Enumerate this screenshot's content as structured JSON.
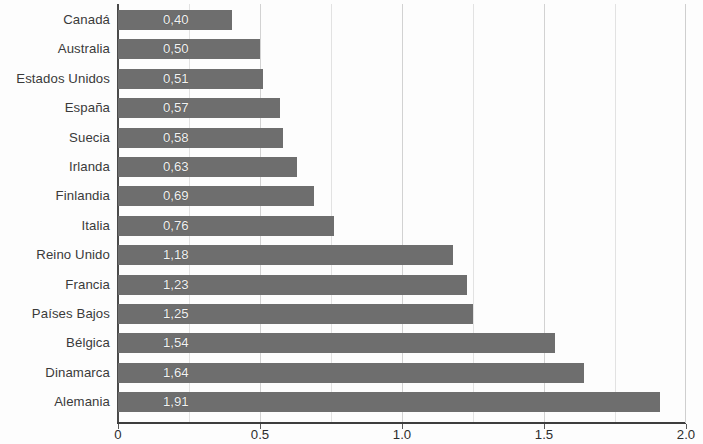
{
  "chart_data": {
    "type": "bar",
    "orientation": "horizontal",
    "title": "",
    "subtitle": "",
    "xlabel": "",
    "ylabel": "",
    "xlim": [
      0,
      2.0
    ],
    "grid": true,
    "legend": null,
    "decimal_separator": ",",
    "categories": [
      "Canadá",
      "Australia",
      "Estados Unidos",
      "España",
      "Suecia",
      "Irlanda",
      "Finlandia",
      "Italia",
      "Reino Unido",
      "Francia",
      "Países Bajos",
      "Bélgica",
      "Dinamarca",
      "Alemania"
    ],
    "values": [
      0.4,
      0.5,
      0.51,
      0.57,
      0.58,
      0.63,
      0.69,
      0.76,
      1.18,
      1.23,
      1.25,
      1.54,
      1.64,
      1.91
    ],
    "value_labels": [
      "0,40",
      "0,50",
      "0,51",
      "0,57",
      "0,58",
      "0,63",
      "0,69",
      "0,76",
      "1,18",
      "1,23",
      "1,25",
      "1,54",
      "1,64",
      "1,91"
    ],
    "x_ticks": [
      0,
      0.5,
      1.0,
      1.5,
      2.0
    ],
    "x_tick_labels": [
      "0",
      "0.5",
      "1.0",
      "1.5",
      "2.0"
    ],
    "minor_gridlines": [
      0.25,
      0.5,
      0.75,
      1.0,
      1.25,
      1.5,
      1.75
    ],
    "colors": {
      "bar": "#6e6e6e",
      "bar_label": "#f2f2f2",
      "category_label": "#3a3a3a",
      "axis": "#3d3d3d",
      "gridline": "#e2e2e2",
      "background": "#fdfdfd"
    }
  }
}
